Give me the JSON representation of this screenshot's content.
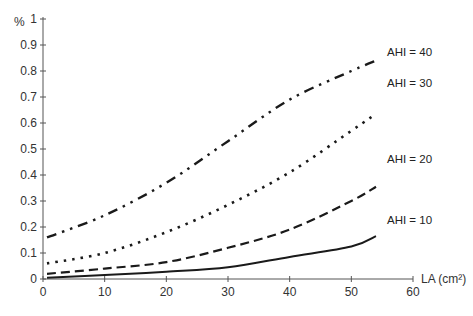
{
  "chart_data": {
    "type": "line",
    "title": "",
    "xlabel": "LA (cm²)",
    "ylabel": "%",
    "xlim": [
      0,
      60
    ],
    "ylim": [
      0,
      1
    ],
    "x_ticks": [
      0,
      10,
      20,
      30,
      40,
      50,
      60
    ],
    "y_ticks": [
      0,
      0.1,
      0.2,
      0.3,
      0.4,
      0.5,
      0.6,
      0.7,
      0.8,
      0.9,
      1
    ],
    "y_tick_labels": [
      "0",
      "0.1",
      "0.2",
      "0.3",
      "0.4",
      "0.5",
      "0.6",
      "0.7",
      "0.8",
      "0.9",
      "1"
    ],
    "grid": false,
    "legend": "inline labels at line ends",
    "x": [
      0,
      10,
      20,
      30,
      40,
      50,
      54
    ],
    "series": [
      {
        "name": "AHI = 10",
        "style": "solid",
        "values": [
          0.005,
          0.015,
          0.028,
          0.045,
          0.085,
          0.125,
          0.165
        ]
      },
      {
        "name": "AHI = 20",
        "style": "dashed",
        "values": [
          0.02,
          0.04,
          0.065,
          0.12,
          0.19,
          0.3,
          0.355
        ]
      },
      {
        "name": "AHI = 30",
        "style": "dotted",
        "values": [
          0.06,
          0.1,
          0.18,
          0.285,
          0.41,
          0.57,
          0.635
        ]
      },
      {
        "name": "AHI = 40",
        "style": "dash-dot",
        "values": [
          0.16,
          0.245,
          0.37,
          0.53,
          0.69,
          0.8,
          0.84
        ]
      }
    ]
  },
  "colors": {
    "line": "#1a1a1a",
    "axis": "#555555"
  }
}
